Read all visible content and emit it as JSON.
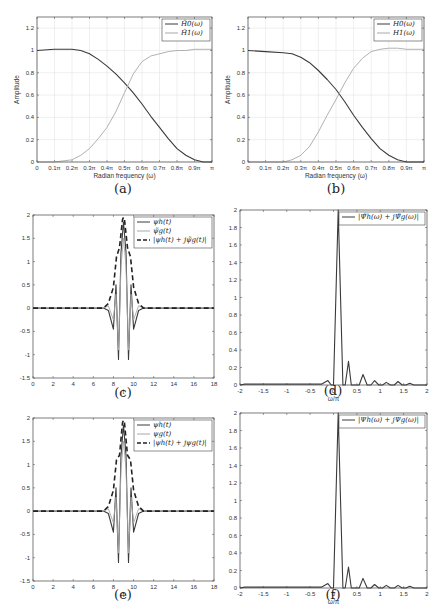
{
  "figure": {
    "captions": [
      "(a)",
      "(b)",
      "(c)",
      "(d)",
      "(e)",
      "(f)"
    ]
  },
  "colors": {
    "dark_line": "#3a3a3a",
    "light_line": "#a8a8a8",
    "grid": "#e4e4e4",
    "axis": "#444444"
  },
  "chart_data": [
    {
      "id": "a",
      "type": "line",
      "title": "",
      "xlabel": "Radian frequency (ω)",
      "ylabel": "Amplitude",
      "xlim": [
        0,
        1
      ],
      "ylim": [
        0,
        1.3
      ],
      "grid": true,
      "legend_position": "upper right",
      "xtick_labels": [
        "0",
        "0.1π",
        "0.2π",
        "0.3π",
        "0.4π",
        "0.5π",
        "0.6π",
        "0.7π",
        "0.8π",
        "0.9π",
        "π"
      ],
      "ytick_labels": [
        "0",
        "0.2",
        "0.4",
        "0.6",
        "0.8",
        "1",
        "1.2"
      ],
      "x": [
        0,
        0.1,
        0.2,
        0.25,
        0.3,
        0.35,
        0.4,
        0.45,
        0.5,
        0.55,
        0.6,
        0.65,
        0.7,
        0.75,
        0.8,
        0.85,
        0.9,
        0.95,
        1.0
      ],
      "series": [
        {
          "name": "H̃0(ω)",
          "style": "dark",
          "values": [
            1.0,
            1.01,
            1.01,
            1.0,
            0.97,
            0.92,
            0.86,
            0.79,
            0.71,
            0.62,
            0.52,
            0.41,
            0.31,
            0.21,
            0.12,
            0.06,
            0.02,
            0.0,
            0.0
          ]
        },
        {
          "name": "H̃1(ω)",
          "style": "light",
          "values": [
            0.0,
            0.0,
            0.02,
            0.06,
            0.12,
            0.21,
            0.31,
            0.45,
            0.62,
            0.79,
            0.9,
            0.95,
            0.97,
            0.99,
            1.0,
            1.0,
            1.01,
            1.01,
            1.01
          ]
        }
      ]
    },
    {
      "id": "b",
      "type": "line",
      "title": "",
      "xlabel": "Radian frequency (ω)",
      "ylabel": "Amplitude",
      "xlim": [
        0,
        1
      ],
      "ylim": [
        0,
        1.3
      ],
      "grid": true,
      "legend_position": "upper right",
      "xtick_labels": [
        "0",
        "0.1π",
        "0.2π",
        "0.3π",
        "0.4π",
        "0.5π",
        "0.6π",
        "0.7π",
        "0.8π",
        "0.9π",
        "π"
      ],
      "ytick_labels": [
        "0",
        "0.2",
        "0.4",
        "0.6",
        "0.8",
        "1",
        "1.2"
      ],
      "x": [
        0,
        0.1,
        0.2,
        0.25,
        0.3,
        0.35,
        0.4,
        0.45,
        0.5,
        0.55,
        0.6,
        0.65,
        0.7,
        0.75,
        0.8,
        0.85,
        0.9,
        0.95,
        1.0
      ],
      "series": [
        {
          "name": "H0(ω)",
          "style": "dark",
          "values": [
            1.0,
            0.99,
            0.98,
            0.97,
            0.94,
            0.89,
            0.82,
            0.74,
            0.65,
            0.54,
            0.42,
            0.31,
            0.21,
            0.12,
            0.06,
            0.02,
            0.0,
            0.0,
            0.0
          ]
        },
        {
          "name": "H1(ω)",
          "style": "light",
          "values": [
            0.0,
            0.0,
            0.0,
            0.02,
            0.06,
            0.14,
            0.27,
            0.42,
            0.56,
            0.71,
            0.84,
            0.93,
            0.99,
            1.01,
            1.02,
            1.02,
            1.01,
            1.01,
            1.01
          ]
        }
      ]
    },
    {
      "id": "c",
      "type": "line",
      "title": "",
      "xlabel": "t",
      "ylabel": "",
      "xlim": [
        0,
        18
      ],
      "ylim": [
        -1.5,
        2
      ],
      "grid": false,
      "legend_position": "upper right",
      "xtick_labels": [
        "0",
        "2",
        "4",
        "6",
        "8",
        "10",
        "12",
        "14",
        "16",
        "18"
      ],
      "ytick_labels": [
        "-1.5",
        "-1",
        "-0.5",
        "0",
        "0.5",
        "1",
        "1.5",
        "2"
      ],
      "series": [
        {
          "name": "ψh(t)",
          "style": "dark",
          "x": [
            0,
            7.0,
            7.5,
            8.0,
            8.25,
            8.5,
            8.75,
            9.0,
            9.25,
            9.5,
            9.75,
            10.0,
            10.5,
            11.0,
            18
          ],
          "values": [
            0,
            0,
            -0.05,
            -0.45,
            0.5,
            -1.1,
            1.2,
            1.85,
            1.2,
            -1.1,
            0.5,
            -0.45,
            -0.05,
            0,
            0
          ]
        },
        {
          "name": "ψ̃g(t)",
          "style": "light",
          "x": [
            0,
            7.0,
            7.5,
            8.0,
            8.25,
            8.5,
            8.75,
            9.0,
            9.25,
            9.5,
            9.75,
            10.0,
            10.5,
            11.0,
            18
          ],
          "values": [
            0,
            0,
            0.05,
            -0.25,
            0.3,
            -0.9,
            0.9,
            1.5,
            0.9,
            -0.9,
            0.3,
            -0.25,
            0.05,
            0,
            0
          ]
        },
        {
          "name": "|ψh(t) + jψ̃g(t)|",
          "style": "dashed",
          "x": [
            0,
            7.0,
            7.5,
            8.0,
            8.3,
            8.6,
            8.9,
            9.0,
            9.1,
            9.4,
            9.7,
            10.0,
            10.5,
            11.0,
            18
          ],
          "values": [
            0,
            0,
            0.1,
            0.45,
            1.1,
            1.3,
            1.9,
            1.95,
            1.9,
            1.3,
            1.1,
            0.45,
            0.1,
            0,
            0
          ]
        }
      ]
    },
    {
      "id": "d",
      "type": "line",
      "title": "",
      "xlabel": "ω/π",
      "ylabel": "",
      "xlim": [
        -2,
        2
      ],
      "ylim": [
        0,
        2
      ],
      "grid": false,
      "legend_position": "upper right",
      "xtick_labels": [
        "-2",
        "-1.5",
        "-1",
        "-0.5",
        "0",
        "0.5",
        "1",
        "1.5",
        "2"
      ],
      "ytick_labels": [
        "0",
        "0.2",
        "0.4",
        "0.6",
        "0.8",
        "1",
        "1.2",
        "1.4",
        "1.6",
        "1.8",
        "2"
      ],
      "series": [
        {
          "name": "|Ψ̃h(ω) + jΨ̃g(ω)|",
          "style": "dark",
          "x": [
            -2,
            -1.9,
            -1.6,
            -1.35,
            -0.9,
            -0.55,
            -0.25,
            -0.12,
            -0.05,
            0.0,
            0.1,
            0.2,
            0.25,
            0.32,
            0.38,
            0.45,
            0.55,
            0.63,
            0.72,
            0.8,
            0.88,
            0.97,
            1.05,
            1.13,
            1.22,
            1.3,
            1.38,
            1.47,
            1.55,
            1.63,
            1.72,
            2
          ],
          "values": [
            0,
            0.01,
            0.01,
            0.01,
            0.01,
            0.01,
            0.01,
            0.05,
            0.0,
            0.0,
            2.0,
            0.0,
            0.0,
            0.27,
            0.0,
            0.0,
            0.0,
            0.12,
            0.0,
            0.0,
            0.05,
            0.0,
            0.0,
            0.03,
            0.0,
            0.0,
            0.04,
            0.0,
            0.0,
            0.02,
            0.0,
            0.0
          ]
        }
      ]
    },
    {
      "id": "e",
      "type": "line",
      "title": "",
      "xlabel": "t",
      "ylabel": "",
      "xlim": [
        0,
        18
      ],
      "ylim": [
        -1.5,
        2
      ],
      "grid": false,
      "legend_position": "upper right",
      "xtick_labels": [
        "0",
        "2",
        "4",
        "6",
        "8",
        "10",
        "12",
        "14",
        "16",
        "18"
      ],
      "ytick_labels": [
        "-1.5",
        "-1",
        "-0.5",
        "0",
        "0.5",
        "1",
        "1.5",
        "2"
      ],
      "series": [
        {
          "name": "ψh(t)",
          "style": "dark",
          "x": [
            0,
            7.0,
            7.5,
            8.0,
            8.25,
            8.5,
            8.75,
            9.0,
            9.25,
            9.5,
            9.75,
            10.0,
            10.5,
            11.0,
            18
          ],
          "values": [
            0,
            0,
            -0.05,
            -0.45,
            0.5,
            -1.1,
            1.2,
            1.85,
            1.2,
            -1.1,
            0.5,
            -0.45,
            -0.05,
            0,
            0
          ]
        },
        {
          "name": "ψg(t)",
          "style": "light",
          "x": [
            0,
            7.0,
            7.5,
            8.0,
            8.25,
            8.5,
            8.75,
            9.0,
            9.25,
            9.5,
            9.75,
            10.0,
            10.5,
            11.0,
            18
          ],
          "values": [
            0,
            0,
            0.05,
            -0.25,
            0.3,
            -0.9,
            0.9,
            1.5,
            0.9,
            -0.9,
            0.3,
            -0.25,
            0.05,
            0,
            0
          ]
        },
        {
          "name": "|ψh(t) + jψg(t)|",
          "style": "dashed",
          "x": [
            0,
            7.0,
            7.5,
            8.0,
            8.3,
            8.6,
            8.9,
            9.0,
            9.1,
            9.4,
            9.7,
            10.0,
            10.5,
            11.0,
            18
          ],
          "values": [
            0,
            0,
            0.1,
            0.45,
            1.1,
            1.2,
            1.9,
            1.95,
            1.9,
            1.2,
            1.1,
            0.45,
            0.1,
            0,
            0
          ]
        }
      ]
    },
    {
      "id": "f",
      "type": "line",
      "title": "",
      "xlabel": "ω/π",
      "ylabel": "",
      "xlim": [
        -2,
        2
      ],
      "ylim": [
        0,
        2
      ],
      "grid": false,
      "legend_position": "upper right",
      "xtick_labels": [
        "-2",
        "-1.5",
        "-1",
        "-0.5",
        "0",
        "0.5",
        "1",
        "1.5",
        "2"
      ],
      "ytick_labels": [
        "0",
        "0.2",
        "0.4",
        "0.6",
        "0.8",
        "1",
        "1.2",
        "1.4",
        "1.6",
        "1.8",
        "2"
      ],
      "series": [
        {
          "name": "|Ψh(ω) + jΨg(ω)|",
          "style": "dark",
          "x": [
            -2,
            -1.9,
            -1.6,
            -1.35,
            -0.9,
            -0.55,
            -0.25,
            -0.12,
            -0.05,
            0.0,
            0.1,
            0.2,
            0.25,
            0.32,
            0.38,
            0.45,
            0.55,
            0.63,
            0.72,
            0.8,
            0.88,
            0.97,
            1.05,
            1.13,
            1.22,
            1.3,
            1.38,
            1.47,
            1.55,
            1.63,
            1.72,
            2
          ],
          "values": [
            0,
            0.01,
            0.01,
            0.01,
            0.01,
            0.01,
            0.01,
            0.05,
            0.0,
            0.0,
            2.0,
            0.0,
            0.0,
            0.24,
            0.0,
            0.0,
            0.0,
            0.11,
            0.0,
            0.0,
            0.04,
            0.0,
            0.0,
            0.03,
            0.0,
            0.0,
            0.03,
            0.0,
            0.0,
            0.02,
            0.0,
            0.0
          ]
        }
      ]
    }
  ]
}
